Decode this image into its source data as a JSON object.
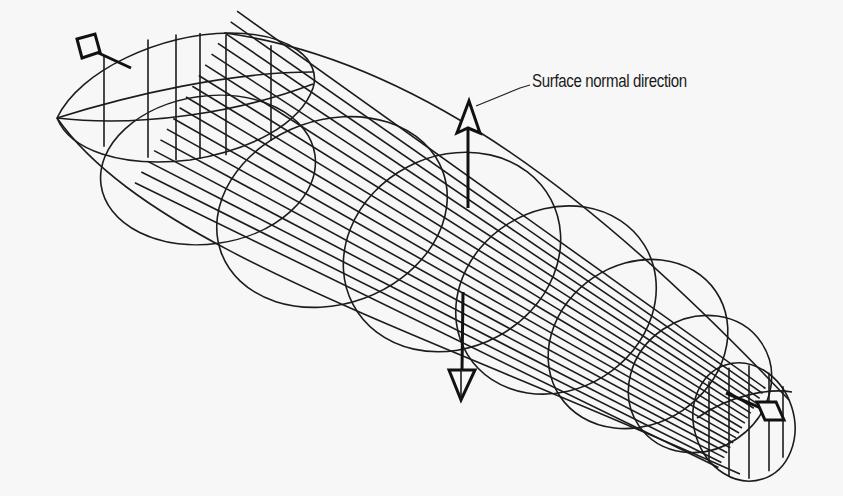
{
  "figure": {
    "annotation_label": "Surface normal direction",
    "colors": {
      "background": "#f7f7f7",
      "line": "#1c1c1c"
    },
    "elements": {
      "tube": "tapered-wireframe-tube",
      "normals": [
        {
          "name": "end-normal-left",
          "direction": "outward-axial"
        },
        {
          "name": "surface-normal-up",
          "direction": "up"
        },
        {
          "name": "surface-normal-down",
          "direction": "down"
        },
        {
          "name": "end-normal-right",
          "direction": "outward-axial"
        }
      ]
    }
  }
}
